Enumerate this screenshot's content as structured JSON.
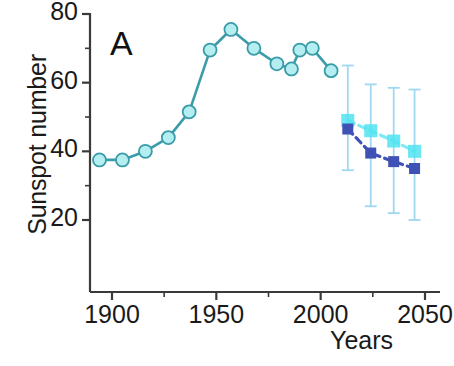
{
  "chart_data": {
    "type": "line",
    "title": "",
    "panel_label": "A",
    "xlabel": "Years",
    "ylabel": "Sunspot number",
    "xlim": [
      1893,
      2057
    ],
    "ylim": [
      14,
      83
    ],
    "xticks": [
      1900,
      1950,
      2000,
      2050
    ],
    "xtick_labels": [
      "1900",
      "1950",
      "2000",
      "2050"
    ],
    "xminor_ticks": [
      1925,
      1975,
      2025
    ],
    "yticks": [
      20,
      40,
      60,
      80
    ],
    "ytick_labels": [
      "20",
      "40",
      "60",
      "80"
    ],
    "yminor_ticks": [
      30,
      50,
      70
    ],
    "grid": false,
    "legend": "none",
    "series": [
      {
        "name": "Observed sunspot cycle averages",
        "marker": "circle",
        "marker_face_color": "#b4eef0",
        "marker_edge_color": "#3a9ca8",
        "line_color": "#3a9ca8",
        "line_style": "solid",
        "x": [
          1894,
          1905,
          1916,
          1927,
          1937,
          1947,
          1957,
          1968,
          1979,
          1986,
          1990,
          1996,
          2005
        ],
        "y": [
          37.5,
          37.5,
          40.0,
          44.0,
          51.5,
          69.5,
          75.5,
          70.0,
          65.5,
          64.0,
          69.5,
          70.0,
          63.5
        ]
      },
      {
        "name": "Forecast series 1 (light cyan)",
        "marker": "square",
        "marker_face_color": "#4fe3f0",
        "line_color": "#7fe9f5",
        "line_style": "dashed",
        "x": [
          2013,
          2024,
          2035,
          2045
        ],
        "y": [
          49.0,
          46.0,
          43.0,
          40.0
        ]
      },
      {
        "name": "Forecast series 2 (dark blue)",
        "marker": "square",
        "marker_face_color": "#3f51b5",
        "line_color": "#3f51b5",
        "line_style": "dashed",
        "x": [
          2013,
          2024,
          2035,
          2045
        ],
        "y": [
          46.5,
          39.5,
          37.0,
          35.0
        ],
        "error_bars": {
          "color": "#9fd8f0",
          "upper": [
            65.0,
            59.5,
            58.5,
            58.0
          ],
          "lower": [
            34.5,
            24.0,
            22.0,
            20.0
          ]
        }
      }
    ]
  },
  "axis": {
    "y_label_text": "Sunspot number",
    "x_label_text": "Years",
    "panel": "A"
  }
}
